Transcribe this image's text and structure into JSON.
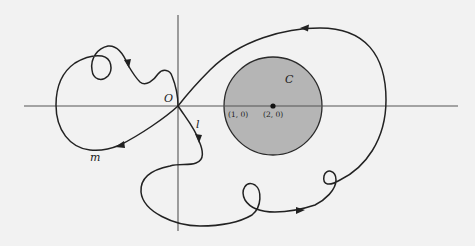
{
  "figure": {
    "labels": {
      "origin": "O",
      "curve_l": "l",
      "curve_m": "m",
      "region": "C",
      "point_a": "(1, 0)",
      "point_b": "(2, 0)"
    },
    "colors": {
      "background": "#f2f2f2",
      "disk_fill": "#b5b5b5",
      "curve": "#222222",
      "axis": "#555555"
    }
  }
}
